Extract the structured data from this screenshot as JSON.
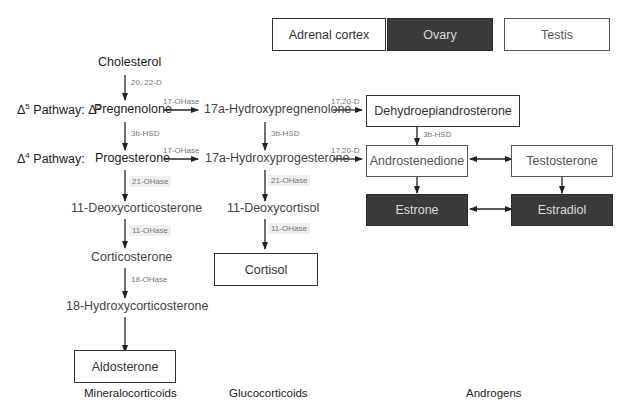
{
  "legend": {
    "items": [
      {
        "label": "Adrenal cortex",
        "style": "outlined",
        "color": "#ffffff"
      },
      {
        "label": "Ovary",
        "style": "filled",
        "color": "#3b3b3b"
      },
      {
        "label": "Testis",
        "style": "light-outlined",
        "color": "#ffffff"
      }
    ]
  },
  "pathway_labels": {
    "delta5_symbol": "Δ",
    "delta5_sup": "5",
    "delta5_text": "Pathway:",
    "delta5_symbol2": "Δ",
    "delta5_sup2": "5",
    "delta4_symbol": "Δ",
    "delta4_sup": "4",
    "delta4_text": "Pathway:"
  },
  "nodes": {
    "cholesterol": "Cholesterol",
    "pregnenolone": "Pregnenolone",
    "hydroxypregnenolone": "17a-Hydroxypregnenolone",
    "dhea": "Dehydroepiandrosterone",
    "progesterone": "Progesterone",
    "hydroxyprogesterone": "17a-Hydroxyprogesterone",
    "androstenedione": "Androstenedione",
    "testosterone": "Testosterone",
    "deoxycorticosterone": "11-Deoxycorticosterone",
    "deoxycortisol": "11-Deoxycortisol",
    "estrone": "Estrone",
    "estradiol": "Estradiol",
    "corticosterone": "Corticosterone",
    "cortisol": "Cortisol",
    "hydroxycorticosterone": "18-Hydroxycorticosterone",
    "aldosterone": "Aldosterone"
  },
  "enzymes": {
    "chol_to_preg": "20, 22-D",
    "preg_to_17ohpreg": "17-OHase",
    "17ohpreg_to_dhea": "17,20-D",
    "preg_to_prog": "3b-HSD",
    "17ohpreg_to_17ohprog": "3b-HSD",
    "dhea_to_andro": "3b-HSD",
    "prog_to_17ohprog": "17-OHase",
    "17ohprog_to_andro": "17,20-D",
    "prog_to_doc": "21-OHase",
    "17ohprog_to_deoxycortisol": "21-OHase",
    "doc_to_corticosterone": "11-OHase",
    "deoxycortisol_to_cortisol": "11-OHase",
    "corticosterone_to_18oh": "18-OHase"
  },
  "categories": {
    "mineralocorticoids": "Mineralocorticoids",
    "glucocorticoids": "Glucocorticoids",
    "androgens": "Androgens"
  }
}
